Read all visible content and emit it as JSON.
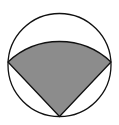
{
  "diagram": {
    "type": "geometry",
    "circle": {
      "cx": 59.5,
      "cy": 65,
      "r": 51.5,
      "stroke": "#111111",
      "fill": "#ffffff"
    },
    "sector": {
      "vertex": [
        59.5,
        116.5
      ],
      "left_point": [
        8,
        62
      ],
      "right_point": [
        111,
        62
      ],
      "radius": 75,
      "fill": "#8c8c8c",
      "stroke": "#111111"
    }
  }
}
